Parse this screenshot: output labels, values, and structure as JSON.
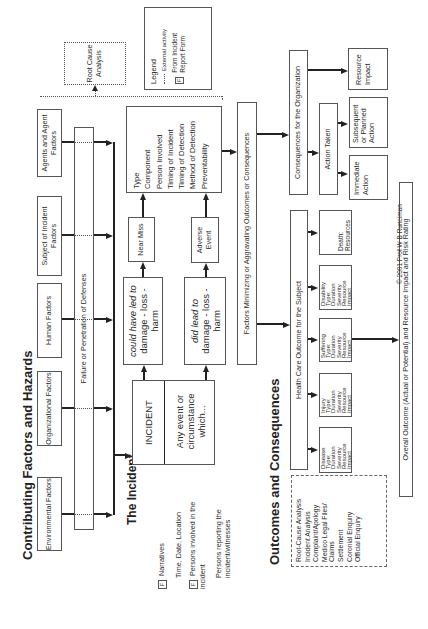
{
  "titles": {
    "contributing": "Contributing Factors and Hazards",
    "incident": "The Incident",
    "outcomes": "Outcomes and Consequences"
  },
  "factors": [
    {
      "label": "Environmental Factors"
    },
    {
      "label": "Organizational Factors"
    },
    {
      "label": "Human Factors"
    },
    {
      "label": "Subject of Incident Factors"
    },
    {
      "label": "Agents and Agent Factors"
    }
  ],
  "failure_bar": "Failure or Penetration of Defenses",
  "root_cause_box": "Root Cause Analysis",
  "legend": {
    "title": "Legend",
    "external": "External activity",
    "f_marker": "F",
    "from_form": "From Incident Report Form"
  },
  "incident": {
    "label": "INCIDENT",
    "definition": "Any event or circumstance which...",
    "could_have_prefix": "could have led to",
    "could_have_rest": "damage - loss - harm",
    "did_lead_prefix": "did lead to",
    "did_lead_rest": "damage - loss - harm",
    "near_miss": "Near Miss",
    "adverse_event": "Adverse Event",
    "attributes": [
      "Type",
      "Component",
      "Person Involved",
      "Timing of Incident",
      "Timing of Detection",
      "Method of Detection",
      "Preventability"
    ]
  },
  "incident_notes": [
    {
      "marker": "F",
      "text": "Narratives"
    },
    {
      "marker": "",
      "text": "Time, Date, Location"
    },
    {
      "marker": "F",
      "text": "Persons involved in the incident"
    },
    {
      "marker": "",
      "text": "Persons reporting the incident/witnesses"
    }
  ],
  "factors_minimizing": "Factors Minimizing or Aggravating Outcomes or Consequences",
  "consequences_org": "Consequences for the Organization",
  "action_taken": "Action Taken",
  "immediate_action": "Immediate Action",
  "subsequent_action": "Subsequent or Planned Action",
  "resource_impact": "Resource Impact",
  "health_care_outcome": "Health Care Outcome for the Subject",
  "outcome_boxes": [
    {
      "name": "disease",
      "lines": [
        "Disease",
        "Type:",
        "Duration",
        "Severity",
        "Resource",
        "Impact"
      ]
    },
    {
      "name": "injury",
      "lines": [
        "Injury",
        "Type:",
        "Duration",
        "Severity",
        "Resource",
        "Impact"
      ]
    },
    {
      "name": "suffering",
      "lines": [
        "Suffering",
        "Type:",
        "Duration",
        "Severity",
        "Resource",
        "Impact"
      ]
    },
    {
      "name": "disability",
      "lines": [
        "Disability",
        "Type:",
        "Duration",
        "Severity",
        "Resource",
        "Impact"
      ]
    },
    {
      "name": "death",
      "lines": [
        "Death:",
        "Resources"
      ]
    }
  ],
  "external_activities": [
    "Root-Cause Analysis",
    "Incident Analysis",
    "Complaint/Apology",
    "Medico Legal Files/",
    "Claims",
    "Settlement",
    "Coronial Enquiry",
    "Official Enquiry"
  ],
  "overall_outcome": "Overall Outcome (Actual or Potential) and Resource Impact and Risk Rating",
  "copyright": "© 2001 Prof W B Runciman"
}
